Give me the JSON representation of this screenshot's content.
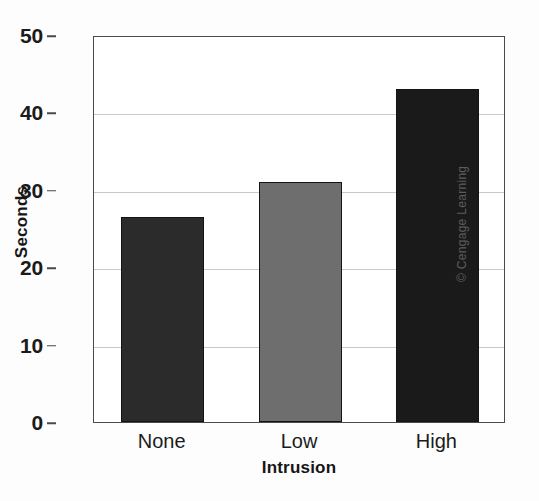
{
  "chart_data": {
    "type": "bar",
    "title": "",
    "xlabel": "Intrusion",
    "ylabel": "Seconds",
    "categories": [
      "None",
      "Low",
      "High"
    ],
    "values": [
      26.5,
      31.0,
      43.0
    ],
    "series": [
      {
        "name": "Seconds",
        "values": [
          26.5,
          31.0,
          43.0
        ]
      }
    ],
    "ylim": [
      0,
      50
    ],
    "yticks": [
      0,
      10,
      20,
      30,
      40,
      50
    ],
    "ytick_labels": [
      "0",
      "10",
      "20",
      "30",
      "40",
      "50"
    ],
    "grid": true,
    "gridlines_at": [
      10,
      20,
      30,
      40
    ],
    "legend": false,
    "legend_position": "none",
    "bar_colors": [
      "#2b2b2b",
      "#6e6e6e",
      "#1a1a1a"
    ],
    "bar_edge_color": "#141414",
    "grid_color": "#c9c9c9",
    "axis_color": "#4a4a4a",
    "plot_background": "#ffffff",
    "page_background": "#fdfdfd",
    "annotations": [
      {
        "name": "copyright-credit",
        "text": "© Cengage Learning",
        "rotation": -90,
        "position": "right-edge"
      }
    ]
  },
  "credit": {
    "text": "© Cengage Learning"
  }
}
